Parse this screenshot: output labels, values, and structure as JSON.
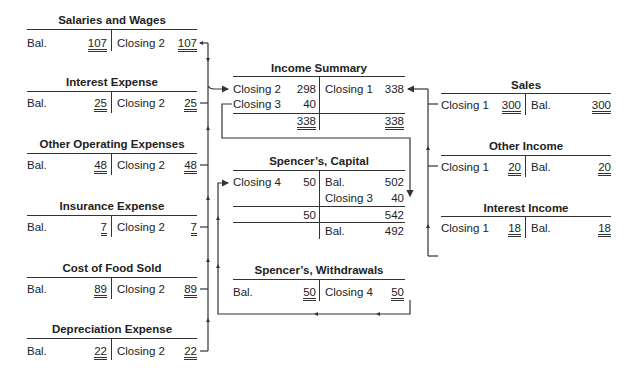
{
  "accounts": {
    "salaries": {
      "title": "Salaries and Wages",
      "left_label": "Bal.",
      "left_value": "107",
      "right_label": "Closing 2",
      "right_value": "107"
    },
    "interest_expense": {
      "title": "Interest Expense",
      "left_label": "Bal.",
      "left_value": "25",
      "right_label": "Closing 2",
      "right_value": "25"
    },
    "other_operating": {
      "title": "Other Operating Expenses",
      "left_label": "Bal.",
      "left_value": "48",
      "right_label": "Closing 2",
      "right_value": "48"
    },
    "insurance": {
      "title": "Insurance Expense",
      "left_label": "Bal.",
      "left_value": "7",
      "right_label": "Closing 2",
      "right_value": "7"
    },
    "cost_food": {
      "title": "Cost of Food Sold",
      "left_label": "Bal.",
      "left_value": "89",
      "right_label": "Closing 2",
      "right_value": "89"
    },
    "depreciation": {
      "title": "Depreciation Expense",
      "left_label": "Bal.",
      "left_value": "22",
      "right_label": "Closing 2",
      "right_value": "22"
    },
    "income_summary": {
      "title": "Income Summary",
      "left": [
        {
          "label": "Closing 2",
          "value": "298"
        },
        {
          "label": "Closing 3",
          "value": "40"
        }
      ],
      "left_total": "338",
      "right": [
        {
          "label": "Closing 1",
          "value": "338"
        }
      ],
      "right_total": "338"
    },
    "capital": {
      "title": "Spencer’s, Capital",
      "left": [
        {
          "label": "Closing 4",
          "value": "50"
        }
      ],
      "right": [
        {
          "label": "Bal.",
          "value": "502"
        },
        {
          "label": "Closing 3",
          "value": "40"
        }
      ],
      "left_subtotal": "50",
      "right_subtotal": "542",
      "ending_label": "Bal.",
      "ending_value": "492"
    },
    "withdrawals": {
      "title": "Spencer’s, Withdrawals",
      "left_label": "Bal.",
      "left_value": "50",
      "right_label": "Closing 4",
      "right_value": "50"
    },
    "sales": {
      "title": "Sales",
      "left_label": "Closing 1",
      "left_value": "300",
      "right_label": "Bal.",
      "right_value": "300"
    },
    "other_income": {
      "title": "Other Income",
      "left_label": "Closing 1",
      "left_value": "20",
      "right_label": "Bal.",
      "right_value": "20"
    },
    "interest_income": {
      "title": "Interest Income",
      "left_label": "Closing 1",
      "left_value": "18",
      "right_label": "Bal.",
      "right_value": "18"
    }
  }
}
